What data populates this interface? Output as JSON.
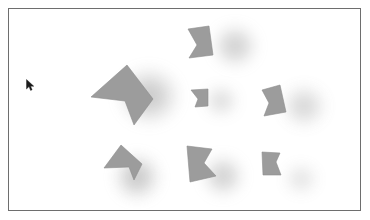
{
  "canvas": {
    "title": "Shape Canvas",
    "width": 370,
    "height": 220,
    "frame": {
      "x": 8,
      "y": 8,
      "width": 353,
      "height": 203
    },
    "background_color": "#ffffff",
    "border_color": "#6e6e6e",
    "shape_fill_color": "#9a9a9a",
    "shape_edge_color": "#8d8d8d",
    "shadow_color": "#8a8a8a",
    "shape_count": 7,
    "shadow_count": 7
  },
  "shapes": [
    {
      "id": "shape-1",
      "name": "crown-top-center",
      "label": "Notched quadrilateral",
      "points": "187,28 208,25 212,54 188,57 196,44",
      "fill": "#9c9c9c",
      "shadow": {
        "cx": 234,
        "cy": 45,
        "rx": 24,
        "ry": 23,
        "opacity": 0.5
      }
    },
    {
      "id": "shape-2",
      "name": "dart-left-large",
      "label": "Large left-pointing dart",
      "points": "126,64 152,98 133,124 124,100 90,96",
      "fill": "#9c9c9c",
      "shadow": {
        "cx": 148,
        "cy": 95,
        "rx": 33,
        "ry": 31,
        "opacity": 0.55
      }
    },
    {
      "id": "shape-3",
      "name": "dart-center-small",
      "label": "Small center dart",
      "points": "190,89 207,88 207,105 194,106 197,98",
      "fill": "#9c9c9c",
      "shadow": {
        "cx": 220,
        "cy": 100,
        "rx": 18,
        "ry": 17,
        "opacity": 0.38
      }
    },
    {
      "id": "shape-4",
      "name": "crown-right-middle",
      "label": "Notched quadrilateral right",
      "points": "261,89 279,84 285,111 263,115 268,102",
      "fill": "#9c9c9c",
      "shadow": {
        "cx": 303,
        "cy": 105,
        "rx": 24,
        "ry": 23,
        "opacity": 0.42
      }
    },
    {
      "id": "shape-5",
      "name": "dart-bottom-left",
      "label": "Bottom-left dart",
      "points": "120,144 141,163 133,179 128,166 103,167",
      "fill": "#9c9c9c",
      "shadow": {
        "cx": 136,
        "cy": 176,
        "rx": 25,
        "ry": 25,
        "opacity": 0.58
      }
    },
    {
      "id": "shape-6",
      "name": "dart-bottom-center",
      "label": "Bottom-center notched shape",
      "points": "186,145 211,148 203,162 215,175 189,181",
      "fill": "#9c9c9c",
      "shadow": {
        "cx": 222,
        "cy": 175,
        "rx": 22,
        "ry": 22,
        "opacity": 0.5
      }
    },
    {
      "id": "shape-7",
      "name": "dart-bottom-right",
      "label": "Bottom-right small dart",
      "points": "261,151 279,152 275,161 280,174 262,174",
      "fill": "#9c9c9c",
      "shadow": {
        "cx": 300,
        "cy": 178,
        "rx": 18,
        "ry": 17,
        "opacity": 0.3
      }
    }
  ],
  "cursor": {
    "name": "mouse-pointer",
    "x": 26,
    "y": 79,
    "color": "#1a1a1a"
  }
}
